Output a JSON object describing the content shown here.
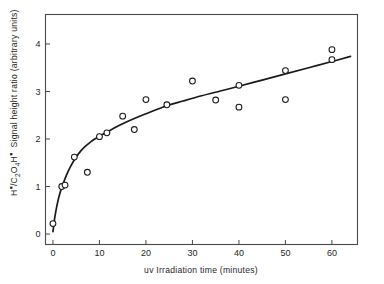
{
  "chart_data": {
    "type": "scatter",
    "title": "",
    "subtitle": "",
    "xlabel": "uv  Irradiation time (minutes)",
    "ylabel": "H•/C2O4H•  Signal height ratio (arbitrary units)",
    "ylabel_parts": {
      "h_symbol": "H",
      "h_dot": "▪",
      "slash": "/C",
      "sub_2": "2",
      "o": "O",
      "sub_4": "4",
      "h2": "H",
      "h2_dot": "▪",
      "rest": "Signal height ratio (arbitrary units)"
    },
    "xlim": [
      -1.6,
      65.5
    ],
    "ylim": [
      -0.22,
      4.62
    ],
    "xticks": [
      0,
      10,
      20,
      30,
      40,
      50,
      60
    ],
    "xtick_labels": [
      "0",
      "10",
      "20",
      "30",
      "40",
      "50",
      "60"
    ],
    "yticks": [
      0,
      1,
      2,
      3,
      4
    ],
    "ytick_labels": [
      "0",
      "1",
      "2",
      "3",
      "4"
    ],
    "grid": false,
    "legend": "none",
    "marker": "open-circle",
    "marker_color": "#1a1a1a",
    "line_color": "#1a1a1a",
    "frame_color": "#4a4a4a",
    "background": "#ffffff",
    "points": [
      {
        "x": 0.0,
        "y": 0.22
      },
      {
        "x": 1.9,
        "y": 1.0
      },
      {
        "x": 2.6,
        "y": 1.03
      },
      {
        "x": 4.6,
        "y": 1.62
      },
      {
        "x": 7.4,
        "y": 1.3
      },
      {
        "x": 10.0,
        "y": 2.05
      },
      {
        "x": 11.6,
        "y": 2.13
      },
      {
        "x": 15.0,
        "y": 2.48
      },
      {
        "x": 17.5,
        "y": 2.2
      },
      {
        "x": 20.0,
        "y": 2.83
      },
      {
        "x": 24.5,
        "y": 2.72
      },
      {
        "x": 30.0,
        "y": 3.22
      },
      {
        "x": 35.0,
        "y": 2.82
      },
      {
        "x": 40.0,
        "y": 3.13
      },
      {
        "x": 40.0,
        "y": 2.67
      },
      {
        "x": 50.0,
        "y": 3.44
      },
      {
        "x": 50.0,
        "y": 2.83
      },
      {
        "x": 60.0,
        "y": 3.88
      },
      {
        "x": 60.0,
        "y": 3.67
      }
    ],
    "fit_curve": {
      "description": "monotonic saturating fit through data",
      "points": [
        {
          "x": 0.0,
          "y": 0.05
        },
        {
          "x": 0.4,
          "y": 0.35
        },
        {
          "x": 0.9,
          "y": 0.62
        },
        {
          "x": 1.5,
          "y": 0.86
        },
        {
          "x": 2.2,
          "y": 1.06
        },
        {
          "x": 3.0,
          "y": 1.26
        },
        {
          "x": 4.0,
          "y": 1.46
        },
        {
          "x": 5.0,
          "y": 1.62
        },
        {
          "x": 6.0,
          "y": 1.75
        },
        {
          "x": 7.0,
          "y": 1.85
        },
        {
          "x": 8.0,
          "y": 1.93
        },
        {
          "x": 9.0,
          "y": 2.0
        },
        {
          "x": 10.0,
          "y": 2.06
        },
        {
          "x": 11.5,
          "y": 2.14
        },
        {
          "x": 13.0,
          "y": 2.22
        },
        {
          "x": 15.0,
          "y": 2.32
        },
        {
          "x": 17.5,
          "y": 2.43
        },
        {
          "x": 20.0,
          "y": 2.53
        },
        {
          "x": 24.5,
          "y": 2.7
        },
        {
          "x": 28.0,
          "y": 2.8
        },
        {
          "x": 32.0,
          "y": 2.91
        },
        {
          "x": 36.0,
          "y": 3.01
        },
        {
          "x": 40.0,
          "y": 3.11
        },
        {
          "x": 45.0,
          "y": 3.24
        },
        {
          "x": 50.0,
          "y": 3.37
        },
        {
          "x": 55.0,
          "y": 3.5
        },
        {
          "x": 60.0,
          "y": 3.63
        },
        {
          "x": 64.0,
          "y": 3.74
        }
      ]
    }
  }
}
